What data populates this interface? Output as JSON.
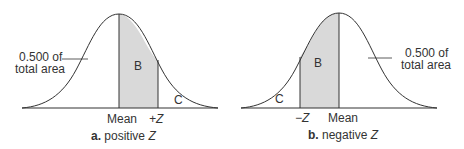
{
  "panels": [
    {
      "id": "a",
      "caption_prefix": "a.",
      "caption_text": "positive ",
      "caption_var": "Z",
      "area_note_line1": "0.500 of",
      "area_note_line2": "total area",
      "region_b": "B",
      "region_c": "C",
      "axis_labels": [
        "Mean",
        "+Z"
      ]
    },
    {
      "id": "b",
      "caption_prefix": "b.",
      "caption_text": "negative ",
      "caption_var": "Z",
      "area_note_line1": "0.500 of",
      "area_note_line2": "total area",
      "region_b": "B",
      "region_c": "C",
      "axis_labels": [
        "−Z",
        "Mean"
      ]
    }
  ],
  "colors": {
    "shade": "#d9d9d9",
    "line": "#333333"
  }
}
